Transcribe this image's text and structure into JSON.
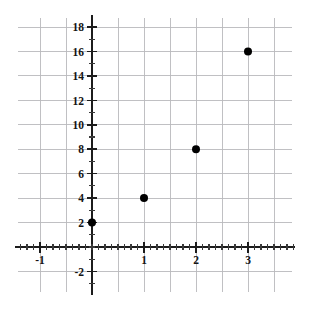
{
  "chart_data": {
    "type": "scatter",
    "title": "",
    "xlabel": "",
    "ylabel": "",
    "x": [
      0,
      1,
      2,
      3
    ],
    "values": [
      2,
      4,
      8,
      16
    ],
    "points": [
      {
        "x": 0,
        "y": 2
      },
      {
        "x": 1,
        "y": 4
      },
      {
        "x": 2,
        "y": 8
      },
      {
        "x": 3,
        "y": 16
      }
    ],
    "series": [
      {
        "name": "",
        "x": [
          0,
          1,
          2,
          3
        ],
        "values": [
          2,
          4,
          8,
          16
        ]
      }
    ],
    "xlim": [
      -1.42,
      3.85
    ],
    "ylim": [
      -3.2,
      20.6
    ],
    "x_tick_labels": [
      "-1",
      "1",
      "2",
      "3"
    ],
    "x_tick_values": [
      -1,
      1,
      2,
      3
    ],
    "y_tick_labels": [
      "-2",
      "2",
      "4",
      "6",
      "8",
      "10",
      "12",
      "14",
      "16",
      "18"
    ],
    "y_tick_values": [
      -2,
      2,
      4,
      6,
      8,
      10,
      12,
      14,
      16,
      18
    ],
    "x_minor_tick_step": 0.125,
    "y_minor_tick_step": 1,
    "x_grid_step": 0.5,
    "y_grid_step": 2,
    "grid": true,
    "legend": "none",
    "marker": "filled-circle",
    "marker_color": "#000000",
    "grid_color": "#b9b9bd",
    "axis_color": "#1c1c1c",
    "background_color": "#ffffff"
  },
  "axes": {
    "x_axis_name": "x-axis",
    "y_axis_name": "y-axis",
    "y_labels": [
      {
        "text": "18",
        "value": 18
      },
      {
        "text": "16",
        "value": 16
      },
      {
        "text": "14",
        "value": 14
      },
      {
        "text": "12",
        "value": 12
      },
      {
        "text": "10",
        "value": 10
      },
      {
        "text": "8",
        "value": 8
      },
      {
        "text": "6",
        "value": 6
      },
      {
        "text": "4",
        "value": 4
      },
      {
        "text": "2",
        "value": 2
      },
      {
        "text": "-2",
        "value": -2
      }
    ],
    "x_labels": [
      {
        "text": "-1",
        "value": -1
      },
      {
        "text": "1",
        "value": 1
      },
      {
        "text": "2",
        "value": 2
      },
      {
        "text": "3",
        "value": 3
      }
    ]
  }
}
